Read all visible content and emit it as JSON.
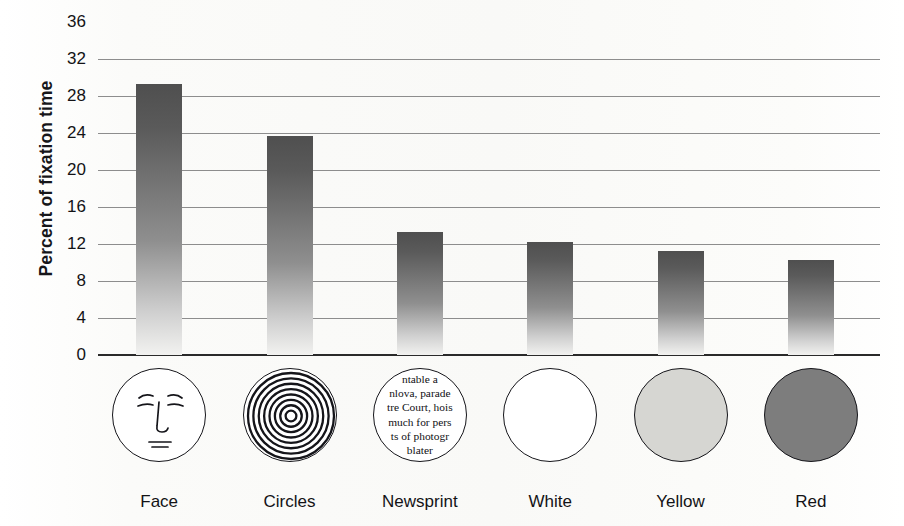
{
  "chart_data": {
    "type": "bar",
    "title": "",
    "xlabel": "",
    "ylabel": "Percent of fixation time",
    "categories": [
      "Face",
      "Circles",
      "Newsprint",
      "White",
      "Yellow",
      "Red"
    ],
    "values": [
      29.3,
      23.7,
      13.3,
      12.2,
      11.2,
      10.3
    ],
    "ylim": [
      0,
      36
    ],
    "yticks": [
      0,
      4,
      8,
      12,
      16,
      20,
      24,
      28,
      32,
      36
    ],
    "ytick_labels": [
      "0",
      "4",
      "8",
      "12",
      "16",
      "20",
      "24",
      "28",
      "32",
      "36"
    ],
    "grid": true,
    "legend": null,
    "bar_color": "#5a5a5a",
    "bar_gradient": [
      "#4f4f4f",
      "#f2f2f0"
    ]
  },
  "axis": {
    "y_title": "Percent of fixation time"
  },
  "icons": [
    {
      "name": "face-icon",
      "label": "Face",
      "kind": "line-drawing-face",
      "fill": "#ffffff"
    },
    {
      "name": "concentric-circles-icon",
      "label": "Circles",
      "kind": "concentric-circles",
      "rings": 8,
      "fill": "#ffffff"
    },
    {
      "name": "newsprint-icon",
      "label": "Newsprint",
      "kind": "newsprint-text",
      "fill": "#ffffff",
      "lines": [
        "ntable a",
        "nlova, parade",
        "tre Court, hois",
        "much for pers",
        "ts of photogr",
        "blater"
      ]
    },
    {
      "name": "white-circle-icon",
      "label": "White",
      "kind": "plain-circle",
      "fill": "#ffffff"
    },
    {
      "name": "yellow-circle-icon",
      "label": "Yellow",
      "kind": "plain-circle",
      "fill": "#d6d6d2"
    },
    {
      "name": "red-circle-icon",
      "label": "Red",
      "kind": "plain-circle",
      "fill": "#7d7d7d"
    }
  ]
}
